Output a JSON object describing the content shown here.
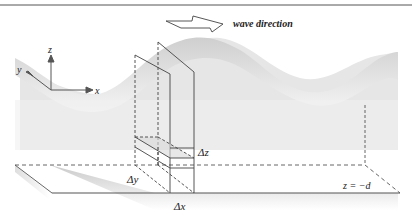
{
  "diagram": {
    "title": "",
    "header_text": "",
    "annotation": {
      "wave_direction": "wave direction"
    },
    "axes": {
      "x": "x",
      "y": "y",
      "z": "z"
    },
    "labels": {
      "delta_x": "Δx",
      "delta_y": "Δy",
      "delta_z": "Δz",
      "bottom": "z = −d"
    },
    "colors": {
      "wave_fill": "#d6d6d6",
      "wave_fill_light": "#ececec",
      "line": "#444444",
      "floor_edge": "#666666"
    }
  }
}
